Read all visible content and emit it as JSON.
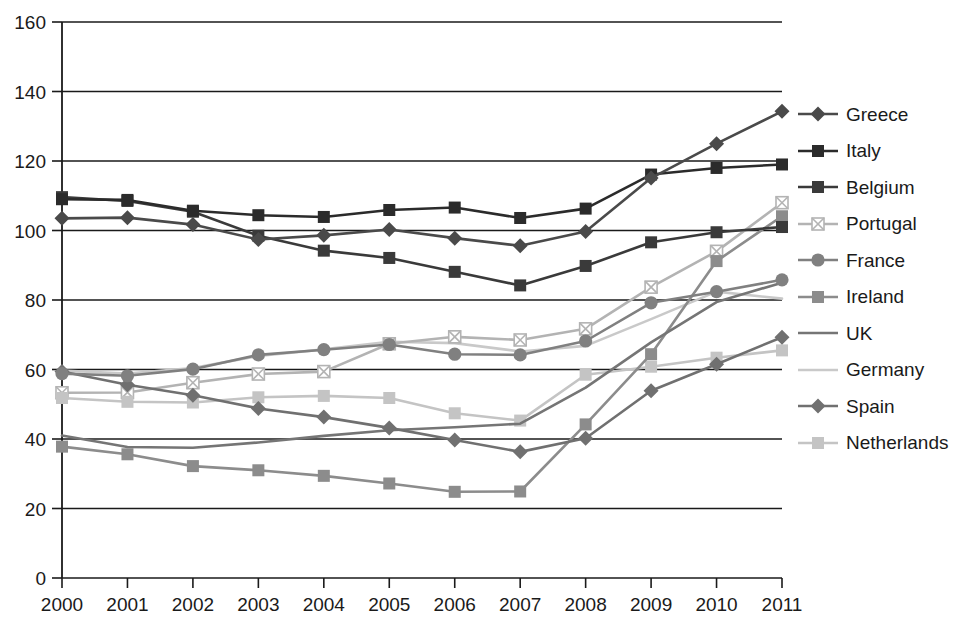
{
  "chart_data": {
    "type": "line",
    "title": "",
    "subtitle": "",
    "xlabel": "",
    "ylabel": "",
    "categories": [
      "2000",
      "2001",
      "2002",
      "2003",
      "2004",
      "2005",
      "2006",
      "2007",
      "2008",
      "2009",
      "2010",
      "2011"
    ],
    "x": [
      2000,
      2001,
      2002,
      2003,
      2004,
      2005,
      2006,
      2007,
      2008,
      2009,
      2010,
      2011
    ],
    "xlim": [
      2000,
      2011
    ],
    "ylim": [
      0,
      160
    ],
    "yticks": [
      0,
      20,
      40,
      60,
      80,
      100,
      120,
      140,
      160
    ],
    "xticks": [
      "2000",
      "2001",
      "2002",
      "2003",
      "2004",
      "2005",
      "2006",
      "2007",
      "2008",
      "2009",
      "2010",
      "2011"
    ],
    "grid": true,
    "legend_position": "right",
    "series": [
      {
        "name": "Greece",
        "color": "#4a4a4a",
        "marker": "diamond",
        "values": [
          103.5,
          103.7,
          101.7,
          97.4,
          98.6,
          100.3,
          97.8,
          95.6,
          99.7,
          115.1,
          125.0,
          134.3
        ]
      },
      {
        "name": "Italy",
        "color": "#2b2b2b",
        "marker": "square",
        "values": [
          109.0,
          108.8,
          105.7,
          104.4,
          103.9,
          105.9,
          106.6,
          103.6,
          106.3,
          116.1,
          118.0,
          119.0
        ]
      },
      {
        "name": "Belgium",
        "color": "#3a3a3a",
        "marker": "square",
        "values": [
          109.6,
          108.5,
          105.4,
          98.5,
          94.2,
          92.1,
          88.1,
          84.2,
          89.8,
          96.6,
          99.5,
          101.0
        ]
      },
      {
        "name": "Portugal",
        "color": "#b3b3b3",
        "marker": "cross-square",
        "values": [
          53.3,
          53.4,
          56.2,
          58.7,
          59.4,
          67.4,
          69.4,
          68.5,
          71.7,
          83.7,
          94.0,
          108.0
        ]
      },
      {
        "name": "France",
        "color": "#808080",
        "marker": "circle",
        "values": [
          58.8,
          58.2,
          60.1,
          64.2,
          65.7,
          67.2,
          64.4,
          64.2,
          68.2,
          79.2,
          82.4,
          85.8
        ]
      },
      {
        "name": "Ireland",
        "color": "#8c8c8c",
        "marker": "square",
        "values": [
          37.8,
          35.6,
          32.2,
          31.0,
          29.4,
          27.2,
          24.8,
          24.9,
          44.2,
          64.4,
          91.2,
          104.1
        ]
      },
      {
        "name": "UK",
        "color": "#757575",
        "marker": "none",
        "values": [
          41.0,
          37.7,
          37.5,
          39.0,
          40.9,
          42.5,
          43.4,
          44.4,
          54.8,
          67.8,
          79.4,
          85.0
        ]
      },
      {
        "name": "Germany",
        "color": "#c9c9c9",
        "marker": "none",
        "values": [
          59.7,
          58.8,
          60.4,
          63.9,
          65.8,
          68.0,
          67.6,
          65.2,
          66.8,
          74.5,
          82.4,
          80.4
        ]
      },
      {
        "name": "Spain",
        "color": "#707070",
        "marker": "diamond",
        "values": [
          59.4,
          55.6,
          52.6,
          48.8,
          46.3,
          43.2,
          39.7,
          36.3,
          40.2,
          53.9,
          61.5,
          69.3
        ]
      },
      {
        "name": "Netherlands",
        "color": "#c4c4c4",
        "marker": "square",
        "values": [
          51.8,
          50.7,
          50.5,
          52.0,
          52.4,
          51.8,
          47.4,
          45.3,
          58.5,
          60.8,
          63.4,
          65.5
        ]
      }
    ]
  },
  "legend": {
    "items": [
      {
        "label": "Greece"
      },
      {
        "label": "Italy"
      },
      {
        "label": "Belgium"
      },
      {
        "label": "Portugal"
      },
      {
        "label": "France"
      },
      {
        "label": "Ireland"
      },
      {
        "label": "UK"
      },
      {
        "label": "Germany"
      },
      {
        "label": "Spain"
      },
      {
        "label": "Netherlands"
      }
    ]
  }
}
